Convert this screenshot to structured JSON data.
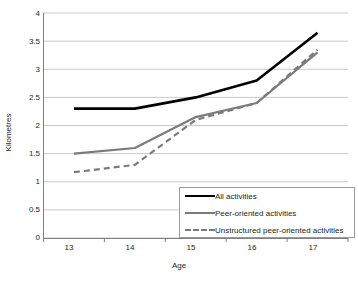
{
  "chart_data": {
    "type": "line",
    "title": "",
    "xlabel": "Age",
    "ylabel": "Kilometres",
    "categories": [
      "13",
      "14",
      "15",
      "16",
      "17"
    ],
    "x": [
      13,
      14,
      15,
      16,
      17
    ],
    "ylim": [
      0,
      4
    ],
    "ytick_labels": [
      "0",
      "0.5",
      "1",
      "1.5",
      "2",
      "2.5",
      "3",
      "3.5",
      "4"
    ],
    "ytick_values": [
      0,
      0.5,
      1,
      1.5,
      2,
      2.5,
      3,
      3.5,
      4
    ],
    "grid": "horizontal",
    "legend_position": "bottom-right",
    "series": [
      {
        "name": "All activities",
        "values": [
          2.3,
          2.3,
          2.5,
          2.8,
          3.65
        ],
        "color": "#000000",
        "style": "solid",
        "width": 2.6
      },
      {
        "name": "Peer-oriented activities",
        "values": [
          1.5,
          1.6,
          2.15,
          2.4,
          3.3
        ],
        "color": "#7b7b7b",
        "style": "solid",
        "width": 2.2
      },
      {
        "name": "Unstructured peer-oriented activities",
        "values": [
          1.17,
          1.3,
          2.1,
          2.4,
          3.35
        ],
        "color": "#7b7b7b",
        "style": "dashed",
        "width": 2.2
      }
    ]
  },
  "axes": {
    "y_label": "Kilometres",
    "x_label": "Age",
    "y_ticks": [
      "4",
      "3.5",
      "3",
      "2.5",
      "2",
      "1.5",
      "1",
      "0.5",
      "0"
    ],
    "x_ticks": [
      "13",
      "14",
      "15",
      "16",
      "17"
    ]
  },
  "legend": {
    "entries": [
      {
        "label": "All activities",
        "swatch": "solid-black-line-icon"
      },
      {
        "label": "Peer-oriented activities",
        "swatch": "solid-gray-line-icon"
      },
      {
        "label": "Unstructured peer-oriented activities",
        "swatch": "dashed-gray-line-icon"
      }
    ]
  },
  "colors": {
    "series_primary": "#000000",
    "series_secondary": "#7b7b7b",
    "grid": "#c8c8c8",
    "axis": "#808080",
    "text": "#231f20"
  }
}
